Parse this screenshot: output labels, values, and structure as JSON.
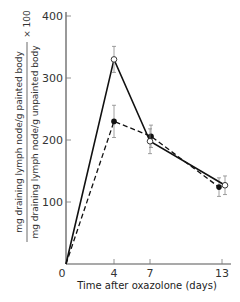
{
  "chart_data": {
    "type": "line",
    "title": "",
    "xlabel": "Time after oxazolone (days)",
    "ylabel": {
      "numerator": "mg draining lymph node/g painted body",
      "denominator": "mg draining lymph node/g unpainted body",
      "multiplier": "× 100"
    },
    "x": [
      0,
      4,
      7,
      13
    ],
    "x_ticks": [
      "0",
      "4",
      "7",
      "13"
    ],
    "y_ticks": [
      "100",
      "200",
      "300",
      "400"
    ],
    "xlim": [
      0,
      13.6
    ],
    "ylim": [
      0,
      410
    ],
    "grid": false,
    "legend": null,
    "series": [
      {
        "name": "open circles (solid line)",
        "marker": "open-circle",
        "line": "solid",
        "values": [
          0,
          330,
          198,
          127
        ],
        "error": [
          0,
          21,
          20,
          15
        ]
      },
      {
        "name": "filled circles (dashed line)",
        "marker": "filled-circle",
        "line": "dashed",
        "values": [
          0,
          230,
          206,
          124
        ],
        "error": [
          0,
          26,
          18,
          15
        ]
      }
    ]
  }
}
